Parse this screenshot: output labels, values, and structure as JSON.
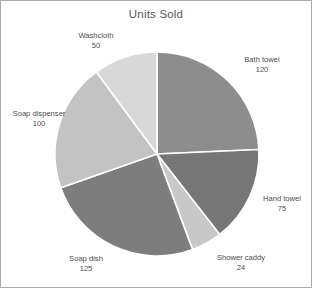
{
  "chart_data": {
    "type": "pie",
    "title": "Units Sold",
    "xlabel": "",
    "ylabel": "",
    "legend": "none",
    "grid": false,
    "start_angle_deg": 0,
    "direction": "clockwise",
    "total": 494,
    "categories": [
      "Bath towel",
      "Hand towel",
      "Shower caddy",
      "Soap dish",
      "Soap dispenser",
      "Washcloth"
    ],
    "values": [
      120,
      75,
      24,
      125,
      100,
      50
    ],
    "colors": [
      "#8d8d8d",
      "#767676",
      "#c8c8c8",
      "#7d7d7d",
      "#c3c3c3",
      "#d8d8d8"
    ],
    "slices": [
      {
        "name": "Bath towel",
        "value": 120,
        "color": "#8d8d8d",
        "label_name": "Bath towel",
        "label_value": "120"
      },
      {
        "name": "Hand towel",
        "value": 75,
        "color": "#767676",
        "label_name": "Hand towel",
        "label_value": "75"
      },
      {
        "name": "Shower caddy",
        "value": 24,
        "color": "#c8c8c8",
        "label_name": "Shower caddy",
        "label_value": "24"
      },
      {
        "name": "Soap dish",
        "value": 125,
        "color": "#7d7d7d",
        "label_name": "Soap dish",
        "label_value": "125"
      },
      {
        "name": "Soap dispenser",
        "value": 100,
        "color": "#c3c3c3",
        "label_name": "Soap dispenser",
        "label_value": "100"
      },
      {
        "name": "Washcloth",
        "value": 50,
        "color": "#d8d8d8",
        "label_name": "Washcloth",
        "label_value": "50"
      }
    ],
    "geometry": {
      "cx": 156,
      "cy": 153,
      "r": 102,
      "separator_color": "#ffffff",
      "separator_width": 1.6
    },
    "frame": {
      "border_color": "#a9a9a9",
      "background": "#ffffff"
    }
  }
}
